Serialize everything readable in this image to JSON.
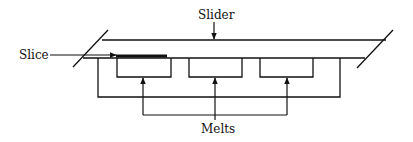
{
  "diagram": {
    "labels": {
      "slider": "Slider",
      "slice": "Slice",
      "melts": "Melts"
    },
    "colors": {
      "line": "#111111",
      "background": "#ffffff"
    },
    "elements": {
      "slider_bar": "Slider (long horizontal channel with slanted ends)",
      "slice": "Slice (thick strip inserted from left)",
      "melt_boxes": [
        "Melt well 1",
        "Melt well 2",
        "Melt well 3"
      ]
    }
  }
}
